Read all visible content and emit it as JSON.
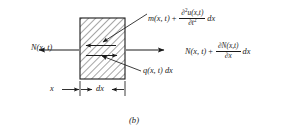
{
  "figure": {
    "caption": "(b)",
    "element_type": "hatched-rectangle"
  },
  "labels": {
    "left_force": {
      "base": "N(x, t)"
    },
    "right_force": {
      "base": "N(x, t)",
      "plus": "+",
      "numerator": "∂N(x,t)",
      "denominator": "∂x",
      "trailing": "dx"
    },
    "top_force": {
      "base": "m(x, t)",
      "plus": "+",
      "numerator_partial": "∂",
      "numerator_order": "2",
      "numerator_rest": "u(x,t)",
      "denominator_partial": "∂t",
      "denominator_order": "2",
      "trailing": "dx"
    },
    "distributed_load": {
      "text": "q(x, t) dx"
    },
    "dimension_x": {
      "text": "x"
    },
    "dimension_dx": {
      "text": "dx"
    }
  },
  "arrows": {
    "left_external": {
      "direction": "left",
      "name": "left-force-arrow"
    },
    "right_external": {
      "direction": "right",
      "name": "right-force-arrow"
    },
    "inner_upper": {
      "direction": "left",
      "name": "inner-upper-arrow"
    },
    "inner_lower": {
      "direction": "right",
      "name": "inner-lower-arrow"
    },
    "leader_top": {
      "direction": "down-left",
      "name": "top-leader-arrow"
    },
    "leader_q": {
      "direction": "up-left",
      "name": "q-leader-arrow"
    }
  },
  "geometry": {
    "box_x": 80,
    "box_y": 18,
    "box_w": 45,
    "box_h": 61,
    "hatch_angle_deg": 45
  },
  "colors": {
    "stroke": "#1a1a1a",
    "background": "#ffffff",
    "hatch": "#3a3a3a"
  }
}
